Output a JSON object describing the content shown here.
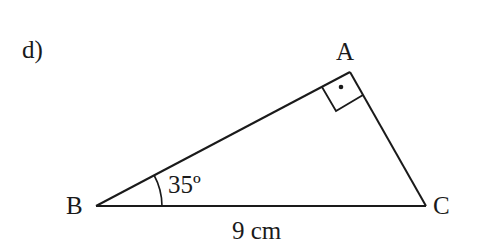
{
  "problem": {
    "label": "d)"
  },
  "triangle": {
    "vertices": {
      "A": "A",
      "B": "B",
      "C": "C"
    },
    "angle_B": "35º",
    "side_BC": "9 cm",
    "right_angle_at": "A"
  },
  "colors": {
    "stroke": "#1a1a1a",
    "background": "#ffffff"
  }
}
